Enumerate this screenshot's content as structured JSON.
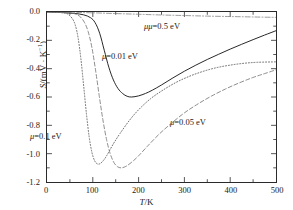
{
  "chart_data": {
    "type": "line",
    "title": "",
    "xlabel": "T/K",
    "ylabel": "S/(mV · K⁻¹)",
    "xlim": [
      0,
      500
    ],
    "ylim": [
      -1.2,
      0.0
    ],
    "xticks": [
      0,
      100,
      200,
      300,
      400,
      500
    ],
    "xticklabels": [
      "0",
      "100",
      "200",
      "300",
      "400",
      "500"
    ],
    "yticks": [
      0.0,
      -0.2,
      -0.4,
      -0.6,
      -0.8,
      -1.0,
      -1.2
    ],
    "yticklabels": [
      "0.0",
      "-0.2",
      "-0.4",
      "-0.6",
      "-0.8",
      "-1.0",
      "-1.2"
    ],
    "xminor_step": 50,
    "yminor_step": 0.1,
    "grid": false,
    "legend": "inline-annotations",
    "series": [
      {
        "name": "μ=0.01 eV",
        "style": "solid",
        "color": "#1a1a1a",
        "x": [
          0,
          20,
          40,
          60,
          80,
          95,
          105,
          115,
          125,
          135,
          145,
          155,
          165,
          175,
          185,
          200,
          215,
          230,
          250,
          275,
          300,
          325,
          350,
          375,
          400,
          425,
          450,
          475,
          500
        ],
        "y": [
          0.0,
          -0.002,
          -0.005,
          -0.01,
          -0.02,
          -0.04,
          -0.075,
          -0.15,
          -0.27,
          -0.39,
          -0.48,
          -0.54,
          -0.575,
          -0.595,
          -0.6,
          -0.592,
          -0.575,
          -0.552,
          -0.515,
          -0.465,
          -0.418,
          -0.375,
          -0.335,
          -0.298,
          -0.262,
          -0.228,
          -0.195,
          -0.163,
          -0.132
        ],
        "minimum": {
          "x": 183,
          "y": -0.6
        }
      },
      {
        "name": "μ=0.1 eV",
        "style": "dotted",
        "color": "#555555",
        "x": [
          0,
          20,
          35,
          45,
          55,
          62,
          68,
          74,
          80,
          86,
          92,
          98,
          104,
          110,
          116,
          124,
          132,
          145,
          160,
          180,
          200,
          225,
          250,
          280,
          310,
          340,
          370,
          400,
          430,
          460,
          500
        ],
        "y": [
          0.0,
          -0.002,
          -0.006,
          -0.014,
          -0.045,
          -0.095,
          -0.185,
          -0.33,
          -0.52,
          -0.715,
          -0.88,
          -0.99,
          -1.05,
          -1.072,
          -1.07,
          -1.045,
          -1.005,
          -0.93,
          -0.855,
          -0.765,
          -0.69,
          -0.615,
          -0.558,
          -0.5,
          -0.455,
          -0.42,
          -0.393,
          -0.375,
          -0.362,
          -0.355,
          -0.352
        ],
        "minimum": {
          "x": 113,
          "y": -1.07
        }
      },
      {
        "name": "μ=0.05 eV",
        "style": "dashed",
        "color": "#777777",
        "x": [
          0,
          25,
          45,
          60,
          72,
          82,
          90,
          98,
          106,
          114,
          122,
          130,
          138,
          146,
          154,
          162,
          172,
          185,
          200,
          220,
          245,
          270,
          300,
          330,
          360,
          390,
          420,
          450,
          475,
          500
        ],
        "y": [
          0.0,
          -0.002,
          -0.005,
          -0.012,
          -0.032,
          -0.075,
          -0.14,
          -0.25,
          -0.41,
          -0.59,
          -0.76,
          -0.9,
          -1.0,
          -1.062,
          -1.092,
          -1.1,
          -1.09,
          -1.06,
          -1.015,
          -0.945,
          -0.862,
          -0.79,
          -0.712,
          -0.648,
          -0.592,
          -0.543,
          -0.5,
          -0.462,
          -0.435,
          -0.408
        ],
        "minimum": {
          "x": 160,
          "y": -1.1
        }
      },
      {
        "name": "μ=0.5 eV",
        "style": "dashdot",
        "color": "#888888",
        "x": [
          0,
          50,
          100,
          150,
          200,
          250,
          300,
          350,
          400,
          450,
          500
        ],
        "y": [
          0.0,
          -0.002,
          -0.006,
          -0.011,
          -0.016,
          -0.021,
          -0.025,
          -0.029,
          -0.032,
          -0.035,
          -0.038
        ],
        "minimum": null
      }
    ],
    "annotations": [
      {
        "text": "μ=0.5 eV",
        "x_px": 143,
        "y_px": 21,
        "series": "μ=0.5 eV"
      },
      {
        "text": "μ=0.01 eV",
        "x_px": 101,
        "y_px": 51,
        "series": "μ=0.01 eV"
      },
      {
        "text": "μ=0.05 eV",
        "x_px": 169,
        "y_px": 117,
        "series": "μ=0.05 eV"
      },
      {
        "text": "μ=0.1 eV",
        "x_px": 29,
        "y_px": 131,
        "series": "μ=0.1 eV"
      }
    ]
  },
  "axes": {
    "x_title_main": "T",
    "x_title_rest": "/K",
    "y_title_main": "S",
    "y_title_rest": "/(mV · K",
    "y_title_exp": "−1",
    "y_title_close": ")"
  }
}
